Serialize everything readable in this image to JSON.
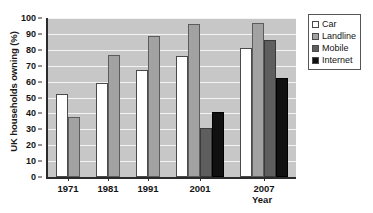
{
  "chart_data": {
    "type": "bar",
    "title": "",
    "xlabel": "Year",
    "ylabel": "UK households owning (%)",
    "categories": [
      "1971",
      "1981",
      "1991",
      "2001",
      "2007"
    ],
    "ylim": [
      0,
      100
    ],
    "yticks": [
      0,
      10,
      20,
      30,
      40,
      50,
      60,
      70,
      80,
      90,
      100
    ],
    "grid": true,
    "legend_position": "right",
    "series": [
      {
        "name": "Car",
        "color": "#ffffff",
        "values": [
          52,
          59,
          67,
          76,
          81
        ]
      },
      {
        "name": "Landline",
        "color": "#a2a2a2",
        "values": [
          38,
          77,
          89,
          96,
          97
        ]
      },
      {
        "name": "Mobile",
        "color": "#5e5e5e",
        "values": [
          null,
          null,
          null,
          31,
          86
        ]
      },
      {
        "name": "Internet",
        "color": "#101010",
        "values": [
          null,
          null,
          null,
          41,
          62
        ]
      }
    ]
  },
  "axes": {
    "y_title": "UK households owning (%)",
    "x_title": "Year"
  },
  "legend": {
    "items": [
      {
        "label": "Car"
      },
      {
        "label": "Landline"
      },
      {
        "label": "Mobile"
      },
      {
        "label": "Internet"
      }
    ]
  }
}
